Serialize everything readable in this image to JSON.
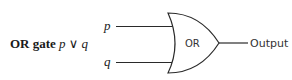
{
  "title": {
    "name": "OR gate",
    "expression": "p ∨ q"
  },
  "gate": {
    "type": "OR",
    "label": "OR",
    "inputs": [
      {
        "label": "p"
      },
      {
        "label": "q"
      }
    ],
    "output_label": "Output"
  },
  "colors": {
    "stroke": "#2a2a2a",
    "text": "#1a1a1a"
  }
}
